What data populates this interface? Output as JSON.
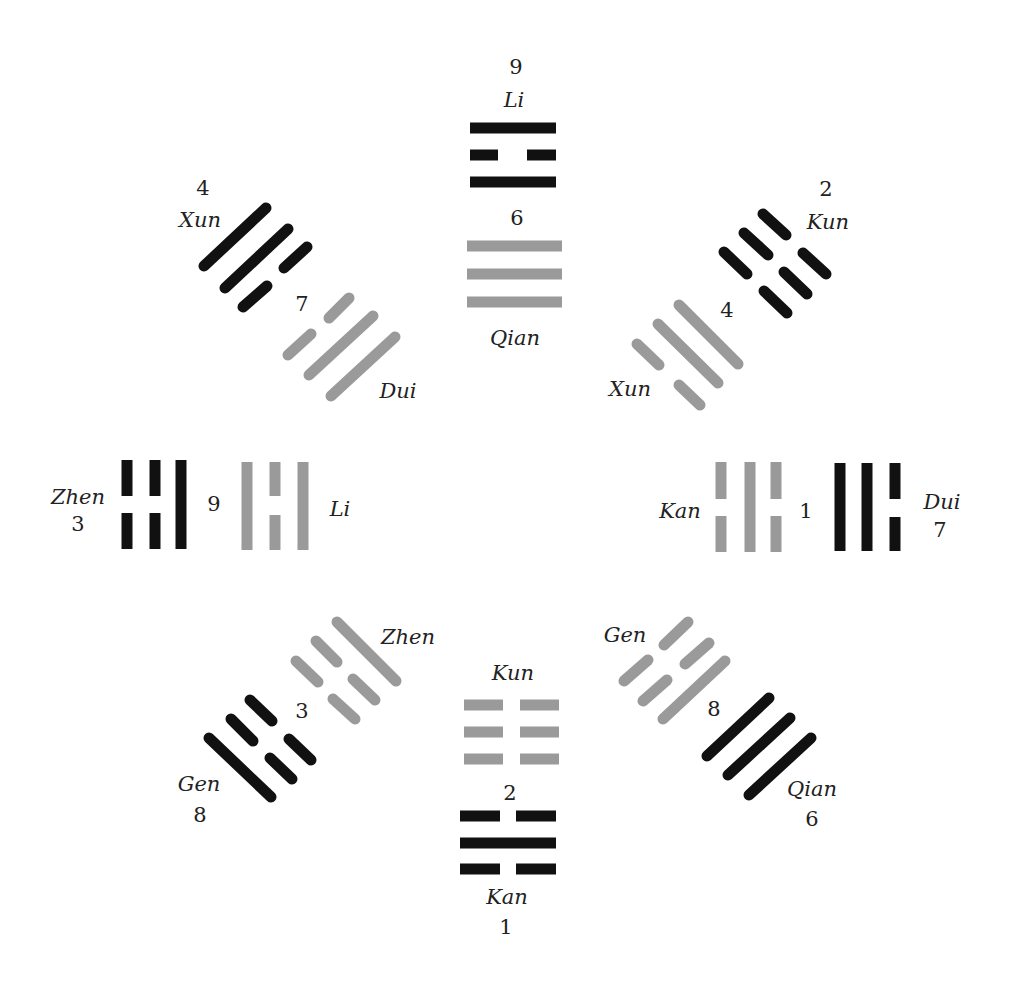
{
  "diagram": {
    "colors": {
      "black": "#111111",
      "gray": "#9a9a9a",
      "text": "#222222"
    },
    "legend_note": "Black trigrams = outer ring, gray trigrams = inner ring",
    "positions": [
      {
        "id": "top",
        "outer": {
          "number": "9",
          "name": "Li",
          "color": "black",
          "lines": [
            "solid",
            "broken",
            "solid"
          ]
        },
        "inner": {
          "number": "6",
          "name": "Qian",
          "color": "gray",
          "lines": [
            "solid",
            "solid",
            "solid"
          ]
        }
      },
      {
        "id": "top-right",
        "outer": {
          "number": "2",
          "name": "Kun",
          "color": "black",
          "lines": [
            "broken",
            "broken",
            "broken"
          ]
        },
        "inner": {
          "number": "4",
          "name": "Xun",
          "color": "gray",
          "lines": [
            "solid",
            "solid",
            "broken"
          ]
        }
      },
      {
        "id": "right",
        "outer": {
          "number": "7",
          "name": "Dui",
          "color": "black",
          "lines": [
            "broken",
            "solid",
            "solid"
          ]
        },
        "inner": {
          "number": "1",
          "name": "Kan",
          "color": "gray",
          "lines": [
            "broken",
            "solid",
            "broken"
          ]
        }
      },
      {
        "id": "bottom-right",
        "outer": {
          "number": "6",
          "name": "Qian",
          "color": "black",
          "lines": [
            "solid",
            "solid",
            "solid"
          ]
        },
        "inner": {
          "number": "8",
          "name": "Gen",
          "color": "gray",
          "lines": [
            "solid",
            "broken",
            "broken"
          ]
        }
      },
      {
        "id": "bottom",
        "outer": {
          "number": "1",
          "name": "Kan",
          "color": "black",
          "lines": [
            "broken",
            "solid",
            "broken"
          ]
        },
        "inner": {
          "number": "2",
          "name": "Kun",
          "color": "gray",
          "lines": [
            "broken",
            "broken",
            "broken"
          ]
        }
      },
      {
        "id": "bottom-left",
        "outer": {
          "number": "8",
          "name": "Gen",
          "color": "black",
          "lines": [
            "solid",
            "broken",
            "broken"
          ]
        },
        "inner": {
          "number": "3",
          "name": "Zhen",
          "color": "gray",
          "lines": [
            "broken",
            "broken",
            "solid"
          ]
        }
      },
      {
        "id": "left",
        "outer": {
          "number": "3",
          "name": "Zhen",
          "color": "black",
          "lines": [
            "broken",
            "broken",
            "solid"
          ]
        },
        "inner": {
          "number": "9",
          "name": "Li",
          "color": "gray",
          "lines": [
            "solid",
            "broken",
            "solid"
          ]
        }
      },
      {
        "id": "top-left",
        "outer": {
          "number": "4",
          "name": "Xun",
          "color": "black",
          "lines": [
            "solid",
            "solid",
            "broken"
          ]
        },
        "inner": {
          "number": "7",
          "name": "Dui",
          "color": "gray",
          "lines": [
            "broken",
            "solid",
            "solid"
          ]
        }
      }
    ]
  }
}
